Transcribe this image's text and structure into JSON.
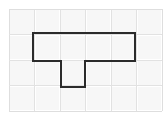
{
  "figure": {
    "title": "T-shaped polygon on square grid",
    "canvas": {
      "width": 166,
      "height": 119,
      "background": "#ffffff"
    },
    "grid": {
      "label": "square grid",
      "origin_x": 9,
      "origin_y": 9,
      "cell_size": 25.5,
      "columns": 6,
      "rows": 4,
      "line_color": "#e2e2e2",
      "cell_color": "#f7f7f7",
      "border_color": "#dedede",
      "visible": true
    },
    "shape": {
      "name": "t-shape",
      "kind": "polygon",
      "stroke_color": "#2b2b2b",
      "stroke_width": 2,
      "fill_color": "none",
      "vertices": [
        [
          33,
          33
        ],
        [
          135,
          33
        ],
        [
          135,
          61
        ],
        [
          85,
          61
        ],
        [
          85,
          87
        ],
        [
          61,
          87
        ],
        [
          61,
          61
        ],
        [
          33,
          61
        ]
      ],
      "vertex_count": 8,
      "closed": true,
      "description": "T-shaped figure: wide horizontal bar of 4 by 1 cells with a 1 by 1 stem descending from the second column"
    }
  }
}
